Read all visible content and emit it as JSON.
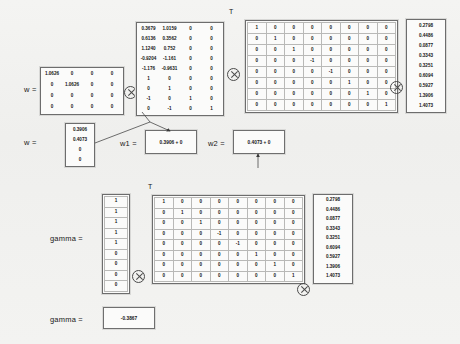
{
  "doc": {
    "operator_symbol": "kron-circle-times",
    "transpose_mark": "T"
  },
  "row1": {
    "label": "w =",
    "weight_matrix": {
      "name": "diagonal-scale-matrix",
      "rows": [
        [
          "1.0626",
          "0",
          "0",
          "0"
        ],
        [
          "0",
          "1.0626",
          "0",
          "0"
        ],
        [
          "0",
          "0",
          "0",
          "0"
        ],
        [
          "0",
          "0",
          "0",
          "0"
        ]
      ]
    },
    "basis_matrix": {
      "name": "design-matrix-transposed",
      "transpose": "T",
      "rows": [
        [
          "0.3679",
          "1.0159",
          "0",
          "0"
        ],
        [
          "0.6136",
          "0.3562",
          "0",
          "0"
        ],
        [
          "1.1240",
          "0.752",
          "0",
          "0"
        ],
        [
          "-0.9204",
          "-1.161",
          "0",
          "0"
        ],
        [
          "-1.176",
          "-0.9631",
          "0",
          "0"
        ],
        [
          "1",
          "0",
          "0",
          "0"
        ],
        [
          "0",
          "1",
          "0",
          "0"
        ],
        [
          "-1",
          "0",
          "1",
          "0"
        ],
        [
          "0",
          "-1",
          "0",
          "1"
        ]
      ]
    },
    "sign_matrix": {
      "name": "signed-identity-matrix",
      "rows": [
        [
          "1",
          "0",
          "0",
          "0",
          "0",
          "0",
          "0",
          "0"
        ],
        [
          "0",
          "1",
          "0",
          "0",
          "0",
          "0",
          "0",
          "0"
        ],
        [
          "0",
          "0",
          "1",
          "0",
          "0",
          "0",
          "0",
          "0"
        ],
        [
          "0",
          "0",
          "0",
          "-1",
          "0",
          "0",
          "0",
          "0"
        ],
        [
          "0",
          "0",
          "0",
          "0",
          "-1",
          "0",
          "0",
          "0"
        ],
        [
          "0",
          "0",
          "0",
          "0",
          "0",
          "1",
          "0",
          "0"
        ],
        [
          "0",
          "0",
          "0",
          "0",
          "0",
          "0",
          "1",
          "0"
        ],
        [
          "0",
          "0",
          "0",
          "0",
          "0",
          "0",
          "0",
          "1"
        ]
      ]
    },
    "result_vector": {
      "name": "observation-vector",
      "values": [
        "0.2798",
        "0.4486",
        "0.0877",
        "0.3343",
        "0.3251",
        "0.6094",
        "0.5927",
        "1.3906",
        "1.4073"
      ]
    }
  },
  "row2": {
    "label": "w =",
    "w_vector": {
      "name": "weight-vector",
      "values": [
        "0.3906",
        "0.4073",
        "0",
        "0"
      ]
    },
    "w1": {
      "label": "w1 =",
      "value": "0.3906 + 0"
    },
    "w2": {
      "label": "w2 =",
      "value": "0.4073 + 0"
    }
  },
  "row3": {
    "label": "gamma =",
    "gamma_vector": {
      "name": "gamma-indicator-vector",
      "transpose": "T",
      "values": [
        "1",
        "1",
        "1",
        "1",
        "1",
        "0",
        "0",
        "0",
        "0"
      ]
    },
    "sign_matrix": {
      "name": "signed-identity-matrix",
      "rows": [
        [
          "1",
          "0",
          "0",
          "0",
          "0",
          "0",
          "0",
          "0"
        ],
        [
          "0",
          "1",
          "0",
          "0",
          "0",
          "0",
          "0",
          "0"
        ],
        [
          "0",
          "0",
          "1",
          "0",
          "0",
          "0",
          "0",
          "0"
        ],
        [
          "0",
          "0",
          "0",
          "-1",
          "0",
          "0",
          "0",
          "0"
        ],
        [
          "0",
          "0",
          "0",
          "0",
          "-1",
          "0",
          "0",
          "0"
        ],
        [
          "0",
          "0",
          "0",
          "0",
          "0",
          "1",
          "0",
          "0"
        ],
        [
          "0",
          "0",
          "0",
          "0",
          "0",
          "0",
          "1",
          "0"
        ],
        [
          "0",
          "0",
          "0",
          "0",
          "0",
          "0",
          "0",
          "1"
        ]
      ]
    },
    "result_vector": {
      "name": "observation-vector",
      "values": [
        "0.2798",
        "0.4486",
        "0.0877",
        "0.3343",
        "0.3251",
        "0.6094",
        "0.5927",
        "1.3906",
        "1.4073"
      ]
    }
  },
  "row4": {
    "label": "gamma =",
    "value": "-0.3867"
  }
}
